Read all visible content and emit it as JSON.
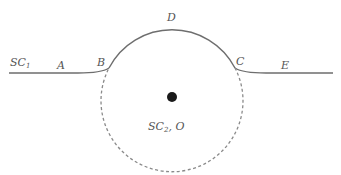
{
  "diagram": {
    "type": "geometric-schematic",
    "colors": {
      "line": "#6e6e6e",
      "dashed": "#8a8a8a",
      "dot": "#1a1a1a",
      "label": "#555555"
    },
    "labels": {
      "sc1_main": "SC",
      "sc1_sub": "1",
      "a": "A",
      "b": "B",
      "c": "C",
      "d": "D",
      "e": "E",
      "sc2_main": "SC",
      "sc2_sub": "2",
      "sc2_suffix": ", O"
    },
    "geometry": {
      "circle_center": [
        172,
        97
      ],
      "circle_radius": 71,
      "baseline_y": 73,
      "baseline_x_start": 9,
      "baseline_x_end": 333,
      "point_b": [
        108,
        70
      ],
      "point_c": [
        236,
        70
      ],
      "dot_radius": 5
    }
  }
}
